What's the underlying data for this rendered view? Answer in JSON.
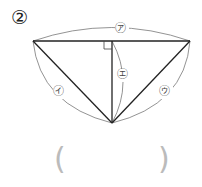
{
  "problem_number": "②",
  "labels": {
    "top": "㋐",
    "left": "㋑",
    "right": "㋒",
    "height": "㋓"
  },
  "answer": {
    "open": "(",
    "close": ")",
    "value": ""
  },
  "colors": {
    "line": "#222222",
    "arc": "#666666",
    "paren": "#bbbbbb"
  }
}
